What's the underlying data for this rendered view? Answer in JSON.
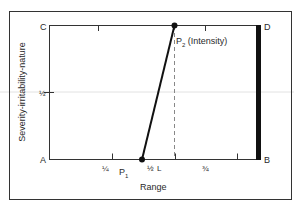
{
  "diagram": {
    "corner_labels": {
      "top_left": "C",
      "top_right": "D",
      "bottom_left": "A",
      "bottom_right": "B"
    },
    "x_axis": {
      "label": "Range",
      "ticks": [
        {
          "value": 0.25,
          "label": "¼"
        },
        {
          "value": 0.5,
          "label": "½"
        },
        {
          "value": 0.75,
          "label": "¾"
        }
      ],
      "marker_label": "L"
    },
    "y_axis": {
      "label": "Severity-irritability-nature",
      "ticks": [
        {
          "value": 0.5,
          "label": "½"
        }
      ]
    },
    "points": {
      "p1": {
        "label_main": "P",
        "label_sub": "1",
        "x": 0.37,
        "y": 0
      },
      "p2": {
        "label_main": "P",
        "label_sub": "2",
        "label_suffix": " (Intensity)",
        "x": 0.5,
        "y": 1
      }
    },
    "dashed_line_x": 0.5,
    "colors": {
      "ink": "#1a1a1a",
      "frame": "#333333",
      "guide": "#d8d8d8"
    }
  }
}
